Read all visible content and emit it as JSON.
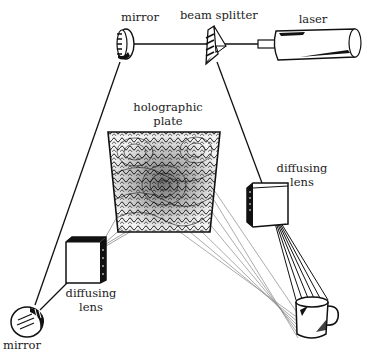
{
  "labels": {
    "mirror_top": "mirror",
    "beam_splitter": "beam splitter",
    "laser": "laser",
    "plate_line1": "holographic",
    "plate_line2": "plate",
    "lens_right_line1": "diffusing",
    "lens_right_line2": "lens",
    "lens_left_line1": "diffusing",
    "lens_left_line2": "lens",
    "mirror_bottom": "mirror"
  },
  "components": [
    {
      "id": "laser",
      "label": "laser"
    },
    {
      "id": "beam-splitter",
      "label": "beam splitter"
    },
    {
      "id": "mirror-top",
      "label": "mirror"
    },
    {
      "id": "mirror-bottom",
      "label": "mirror"
    },
    {
      "id": "diffusing-lens-left",
      "label": "diffusing lens"
    },
    {
      "id": "diffusing-lens-right",
      "label": "diffusing lens"
    },
    {
      "id": "holographic-plate",
      "label": "holographic plate"
    },
    {
      "id": "object-mug",
      "label": ""
    }
  ],
  "beams": [
    {
      "from": "laser",
      "to": "beam-splitter"
    },
    {
      "from": "beam-splitter",
      "to": "mirror-top"
    },
    {
      "from": "beam-splitter",
      "to": "diffusing-lens-right"
    },
    {
      "from": "mirror-top",
      "to": "mirror-bottom"
    },
    {
      "from": "mirror-bottom",
      "to": "diffusing-lens-left"
    },
    {
      "from": "diffusing-lens-left",
      "to": "holographic-plate"
    },
    {
      "from": "diffusing-lens-right",
      "to": "object-mug"
    },
    {
      "from": "object-mug",
      "to": "holographic-plate"
    }
  ],
  "colors": {
    "ink": "#111111",
    "ray": "#777777",
    "background": "#ffffff"
  }
}
